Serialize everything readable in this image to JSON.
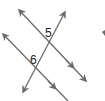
{
  "diagram": {
    "type": "parallel-lines-cut-by-transversal",
    "line_color": "#6b6b6b",
    "label_color": "#222222",
    "angles": [
      {
        "id": "5",
        "label": "5",
        "position": "upper intersection, top-left region"
      },
      {
        "id": "6",
        "label": "6",
        "position": "lower intersection, top-left region"
      }
    ],
    "lines": [
      {
        "name": "upper-parallel-line",
        "parallel_marker": true
      },
      {
        "name": "lower-parallel-line",
        "parallel_marker": true
      },
      {
        "name": "transversal",
        "parallel_marker": false
      }
    ]
  }
}
